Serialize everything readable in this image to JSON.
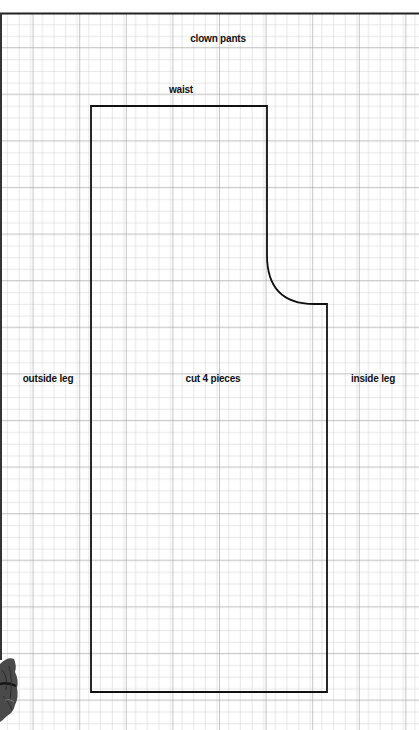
{
  "title": "clown pants",
  "labels": {
    "waist": "waist",
    "outside_leg": "outside leg",
    "center": "cut 4 pieces",
    "inside_leg": "inside leg"
  },
  "grid": {
    "cell_px": 11.65,
    "major_every": 4,
    "minor_color": "#c9c9c9",
    "major_color": "#9a9a9a"
  },
  "pattern_piece": {
    "name": "clown pants leg",
    "outline_color": "#111111",
    "points": {
      "top_left": [
        91,
        106
      ],
      "top_right": [
        267,
        106
      ],
      "curve_start": [
        267,
        255
      ],
      "curve_end": [
        314,
        304
      ],
      "crotch_point": [
        327,
        304
      ],
      "bottom_right": [
        327,
        692
      ],
      "bottom_left": [
        91,
        692
      ]
    }
  },
  "decoration": "ruffle-photo-fragment"
}
